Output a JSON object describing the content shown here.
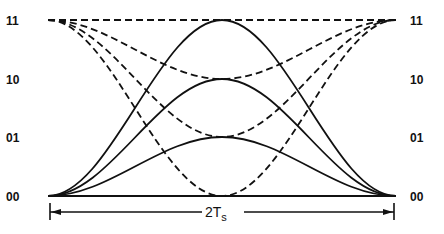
{
  "diagram": {
    "title": "",
    "levels": [
      {
        "label": "11",
        "y": 20
      },
      {
        "label": "10",
        "y": 79
      },
      {
        "label": "01",
        "y": 137
      },
      {
        "label": "00",
        "y": 196
      }
    ],
    "x_start": 48,
    "x_end": 396,
    "interval_label_main": "2T",
    "interval_label_sub": "s",
    "solid_curves": [
      {
        "name": "00-to-11-to-00",
        "peak": "11"
      },
      {
        "name": "00-to-10-to-00",
        "peak": "10"
      },
      {
        "name": "00-to-01-to-00",
        "peak": "01"
      },
      {
        "name": "00-flat",
        "peak": "00"
      }
    ],
    "dashed_curves": [
      {
        "name": "11-flat",
        "trough": "11"
      },
      {
        "name": "11-to-10-to-11",
        "trough": "10"
      },
      {
        "name": "11-to-01-to-11",
        "trough": "01"
      },
      {
        "name": "11-to-00-to-11",
        "trough": "00"
      }
    ]
  }
}
